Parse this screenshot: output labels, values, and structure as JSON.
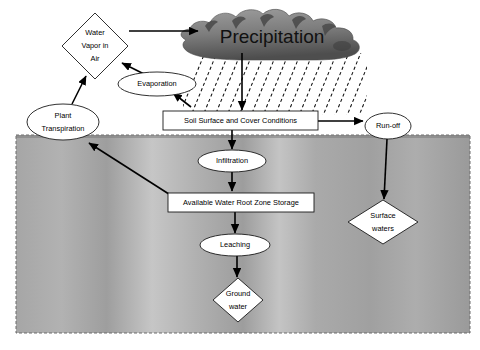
{
  "diagram": {
    "canvas": {
      "width": 480,
      "height": 350,
      "background": "#ffffff"
    },
    "colors": {
      "cloud": "#8a8a8a",
      "cloud_dark": "#585858",
      "soil": "#a9a9a9",
      "soil_light": "#c9c9c9",
      "shape_fill": "#ffffff",
      "stroke": "#1a1a1a",
      "arrow": "#000000"
    },
    "nodes": [
      {
        "id": "water-vapor",
        "label": "Water\nVapor in\nAir",
        "line1": "Water",
        "line2": "Vapor in",
        "line3": "Air",
        "shape": "diamond",
        "cx": 95,
        "cy": 46,
        "rx": 33,
        "ry": 33
      },
      {
        "id": "precipitation",
        "label": "Precipitation",
        "shape": "cloud",
        "cx": 272,
        "cy": 35
      },
      {
        "id": "evaporation",
        "label": "Evaporation",
        "shape": "ellipse",
        "cx": 157,
        "cy": 84,
        "rx": 39,
        "ry": 12
      },
      {
        "id": "plant-transpiration",
        "label": "Plant\nTranspiration",
        "line1": "Plant",
        "line2": "Transpiration",
        "shape": "ellipse",
        "cx": 63,
        "cy": 122,
        "rx": 36,
        "ry": 18
      },
      {
        "id": "soil-surface",
        "label": "Soil Surface and Cover Conditions",
        "shape": "rect",
        "x": 163,
        "y": 111,
        "w": 155,
        "h": 19
      },
      {
        "id": "run-off",
        "label": "Run-off",
        "shape": "ellipse",
        "cx": 388,
        "cy": 126,
        "rx": 23,
        "ry": 13
      },
      {
        "id": "infiltration",
        "label": "Infiltration",
        "shape": "ellipse",
        "cx": 232,
        "cy": 161,
        "rx": 34,
        "ry": 11
      },
      {
        "id": "available-water-root-zone-storage",
        "label": "Available Water Root Zone Storage",
        "shape": "rect",
        "x": 168,
        "y": 193,
        "w": 146,
        "h": 19
      },
      {
        "id": "surface-waters",
        "label": "Surface\nwaters",
        "line1": "Surface",
        "line2": "waters",
        "shape": "diamond",
        "cx": 383,
        "cy": 222,
        "rx": 35,
        "ry": 22
      },
      {
        "id": "leaching",
        "label": "Leaching",
        "shape": "ellipse",
        "cx": 235,
        "cy": 245,
        "rx": 35,
        "ry": 11
      },
      {
        "id": "ground-water",
        "label": "Ground\nwater",
        "line1": "Ground",
        "line2": "water",
        "shape": "diamond",
        "cx": 238,
        "cy": 300,
        "rx": 25,
        "ry": 22
      }
    ],
    "edges": [
      {
        "id": "vapor-to-cloud",
        "from": "water-vapor",
        "to": "precipitation"
      },
      {
        "id": "evaporation-to-vapor",
        "from": "evaporation",
        "to": "water-vapor"
      },
      {
        "id": "transpiration-to-vapor",
        "from": "plant-transpiration",
        "to": "water-vapor"
      },
      {
        "id": "soil-to-evaporation",
        "from": "soil-surface",
        "to": "evaporation"
      },
      {
        "id": "rain-to-soil",
        "from": "precipitation",
        "to": "soil-surface"
      },
      {
        "id": "soil-to-runoff",
        "from": "soil-surface",
        "to": "run-off"
      },
      {
        "id": "soil-to-infiltration",
        "from": "soil-surface",
        "to": "infiltration"
      },
      {
        "id": "infiltration-to-storage",
        "from": "infiltration",
        "to": "available-water-root-zone-storage"
      },
      {
        "id": "storage-to-transpiration",
        "from": "available-water-root-zone-storage",
        "to": "plant-transpiration"
      },
      {
        "id": "storage-to-leaching",
        "from": "available-water-root-zone-storage",
        "to": "leaching"
      },
      {
        "id": "leaching-to-groundwater",
        "from": "leaching",
        "to": "ground-water"
      },
      {
        "id": "runoff-to-surfacewaters",
        "from": "run-off",
        "to": "surface-waters"
      }
    ],
    "soil_region": {
      "x": 16,
      "y": 135,
      "w": 454,
      "h": 198,
      "label": "soil profile"
    },
    "rain_band": {
      "x": 183,
      "y": 55,
      "w": 184,
      "h": 58,
      "label": "rainfall hatching"
    }
  }
}
